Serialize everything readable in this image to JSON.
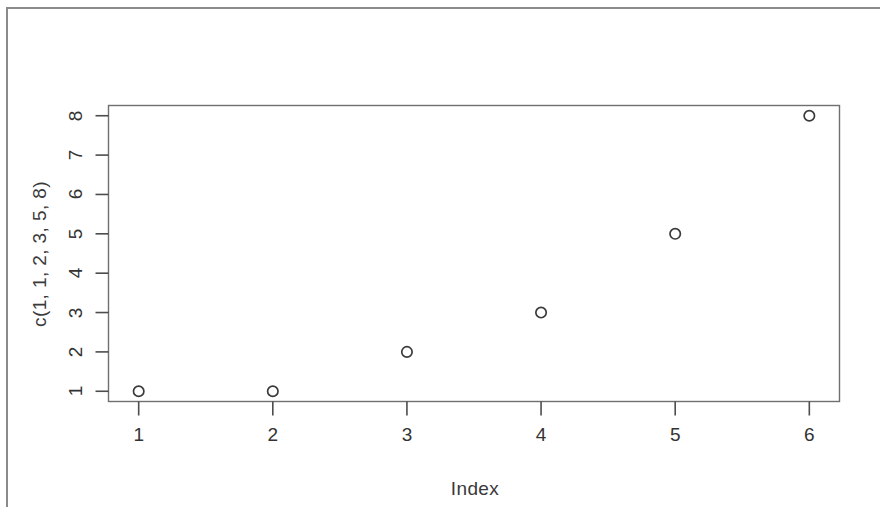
{
  "figure": {
    "background_color": "#ffffff",
    "axis_color": "#4d4d4d",
    "point_color": "#3a3a3a",
    "border_color": "#8a8a8a"
  },
  "chart_data": {
    "type": "scatter",
    "title": "",
    "subtitle": "",
    "xlabel": "Index",
    "ylabel": "c(1, 1, 2, 3, 5, 8)",
    "x": [
      1,
      2,
      3,
      4,
      5,
      6
    ],
    "values": [
      1,
      1,
      2,
      3,
      5,
      8
    ],
    "series": [
      {
        "name": "c(1, 1, 2, 3, 5, 8)",
        "values": [
          1,
          1,
          2,
          3,
          5,
          8
        ]
      }
    ],
    "xticks": [
      "1",
      "2",
      "3",
      "4",
      "5",
      "6"
    ],
    "yticks": [
      "1",
      "2",
      "3",
      "4",
      "5",
      "6",
      "7",
      "8"
    ],
    "xtick_values": [
      1,
      2,
      3,
      4,
      5,
      6
    ],
    "ytick_values": [
      1,
      2,
      3,
      4,
      5,
      6,
      7,
      8
    ],
    "xlim": [
      0.775,
      6.225
    ],
    "ylim": [
      0.74,
      8.26
    ],
    "grid": false,
    "legend": false,
    "legend_position": "none",
    "marker": "open-circle",
    "annotations": []
  }
}
